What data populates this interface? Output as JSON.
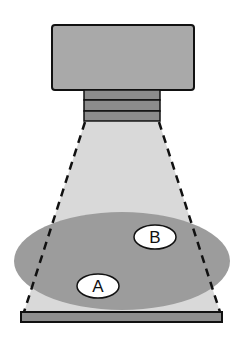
{
  "diagram": {
    "colors": {
      "background": "#ffffff",
      "camera_body": "#a9a9a9",
      "lens_band": "#8c8c8c",
      "beam": "#d9d9d9",
      "ellipse_region": "#9c9c9c",
      "base_bar": "#8e8e8e",
      "outline": "#111111",
      "label_fill": "#ffffff"
    },
    "labels": {
      "a": "A",
      "b": "B"
    }
  }
}
